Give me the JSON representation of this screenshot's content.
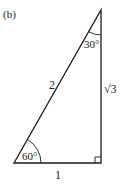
{
  "figure_label": "(b)",
  "triangle": {
    "hypotenuse_label": "2",
    "vertical_leg_label": "√3",
    "base_label": "1",
    "top_angle_label": "30°",
    "bottom_left_angle_label": "60°",
    "right_angle": true
  },
  "colors": {
    "stroke": "#1a1a1a",
    "text": "#222222"
  }
}
